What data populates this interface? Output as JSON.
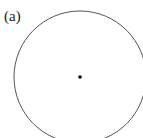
{
  "figure": {
    "label": "(a)",
    "shapes": [
      {
        "type": "circle",
        "description": "circle outline",
        "stroke": "#555555"
      },
      {
        "type": "point",
        "description": "center point",
        "fill": "#000000"
      }
    ]
  }
}
